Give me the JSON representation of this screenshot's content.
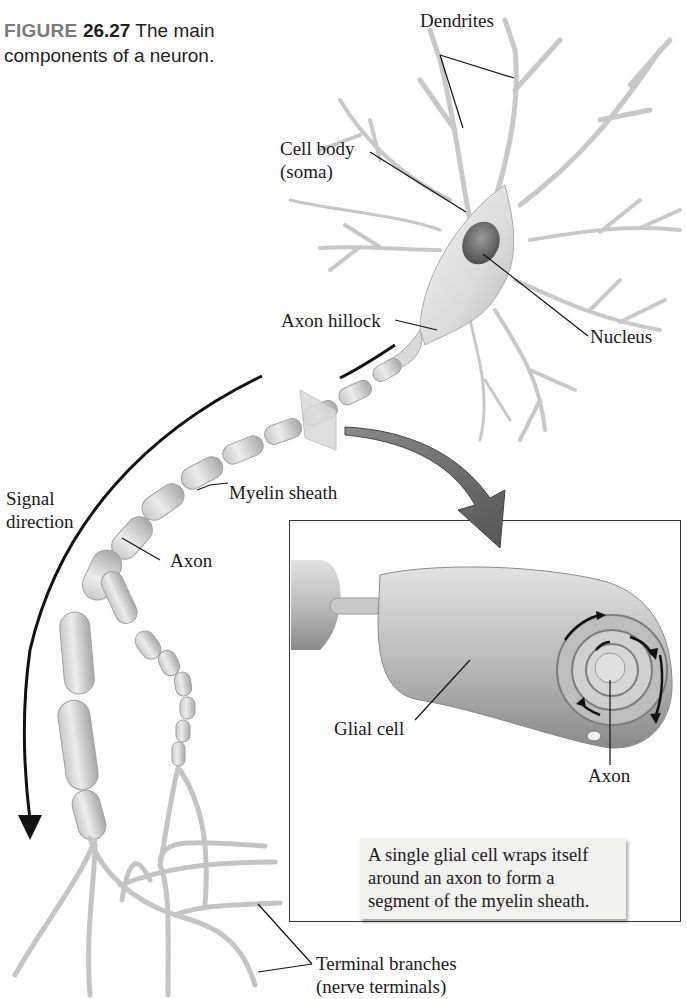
{
  "figure": {
    "label": "FIGURE",
    "number": "26.27",
    "caption_line1": "The main",
    "caption_line2": "components of a neuron."
  },
  "labels": {
    "dendrites": "Dendrites",
    "cell_body_line1": "Cell body",
    "cell_body_line2": "(soma)",
    "axon_hillock": "Axon hillock",
    "nucleus": "Nucleus",
    "signal_direction_line1": "Signal",
    "signal_direction_line2": "direction",
    "myelin_sheath": "Myelin sheath",
    "axon_main": "Axon",
    "terminal_branches_line1": "Terminal branches",
    "terminal_branches_line2": "(nerve terminals)"
  },
  "inset": {
    "glial_cell": "Glial cell",
    "axon": "Axon",
    "note": "A single glial cell wraps itself around an axon to form a segment of the myelin sheath."
  },
  "colors": {
    "figure_label": "#7a7a7a",
    "neuron_fill": "#e4e4e4",
    "neuron_stroke": "#a9a9a9",
    "nucleus": "#6b6b6b",
    "zoom_arrow": "#6e6e6e",
    "note_bg": "#f1f1ef"
  }
}
